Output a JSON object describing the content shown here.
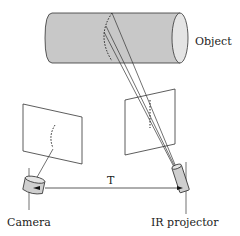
{
  "labels": {
    "object": "Object",
    "camera": "Camera",
    "projector": "IR projector",
    "baseline": "T"
  },
  "colors": {
    "stroke": "#333333",
    "cylinder_fill": "#c8c8c8",
    "cylinder_end_fill": "#e4e4e4",
    "device_fill": "#cfcfcf",
    "background": "#ffffff"
  }
}
